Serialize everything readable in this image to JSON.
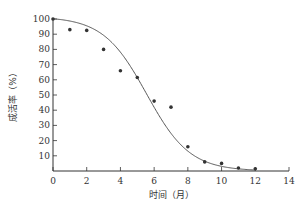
{
  "chart_data": {
    "type": "scatter",
    "title": "",
    "xlabel": "时间（月）",
    "ylabel": "成活率（%）",
    "xlim": [
      0,
      14
    ],
    "ylim": [
      0,
      100
    ],
    "xticks": [
      0,
      2,
      4,
      6,
      8,
      10,
      12,
      14
    ],
    "yticks": [
      10,
      20,
      30,
      40,
      50,
      60,
      70,
      80,
      90,
      100
    ],
    "grid": false,
    "legend": null,
    "series": [
      {
        "name": "observed",
        "kind": "scatter",
        "x": [
          0,
          1,
          2,
          3,
          4,
          5,
          6,
          7,
          8,
          9,
          10,
          11,
          12
        ],
        "y": [
          100,
          93,
          92.5,
          80,
          66,
          61.5,
          46,
          42,
          16,
          6,
          5,
          2,
          1.5
        ]
      },
      {
        "name": "fitted",
        "kind": "line",
        "x": [
          0,
          1,
          2,
          3,
          4,
          5,
          6,
          7,
          8,
          9,
          10,
          11,
          12
        ],
        "y": [
          100,
          99,
          96,
          89,
          76,
          58,
          38,
          21,
          10,
          4.5,
          2,
          1,
          0.5
        ]
      }
    ],
    "colors": {
      "axis": "#333333",
      "points": "#333333",
      "curve": "#555555"
    }
  }
}
